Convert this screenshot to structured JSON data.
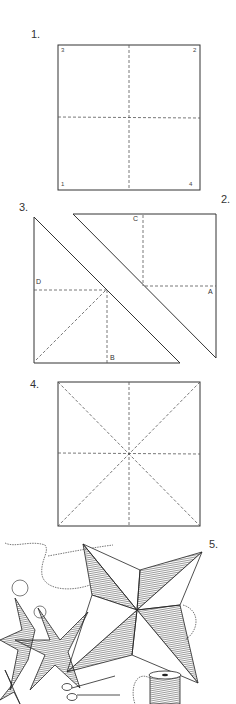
{
  "steps": [
    {
      "id": "step-1",
      "label": "1.",
      "description": "Square folded into quarters",
      "corners": {
        "top_left": "3",
        "top_right": "2",
        "bottom_left": "1",
        "bottom_right": "4"
      }
    },
    {
      "id": "step-2",
      "label": "2.",
      "description": "Right-angle triangle half with fold lines",
      "points": {
        "top": "C",
        "right": "A"
      }
    },
    {
      "id": "step-3",
      "label": "3.",
      "description": "Left triangle half with fold lines",
      "points": {
        "left": "D",
        "bottom": "B"
      }
    },
    {
      "id": "step-4",
      "label": "4.",
      "description": "Square with dashed midlines and diagonals"
    },
    {
      "id": "step-5",
      "label": "5.",
      "description": "Finished hanging paper stars with thread, scissors and spool"
    }
  ],
  "colors": {
    "line": "#333333",
    "dashed": "#555555",
    "background": "#ffffff"
  }
}
